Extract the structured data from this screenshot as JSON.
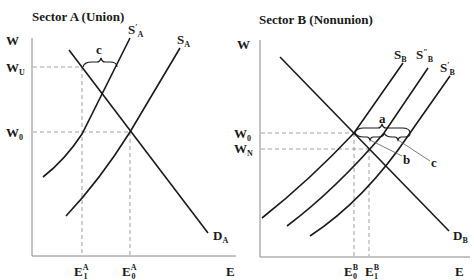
{
  "panels": [
    {
      "title": "Sector A (Union)",
      "y_axis": "W",
      "x_axis": "E",
      "wage_labels": {
        "high": {
          "main": "W",
          "sub": "U"
        },
        "base": {
          "main": "W",
          "sub": "0"
        }
      },
      "employment_labels": [
        {
          "main": "E",
          "sup": "A",
          "sub": "1"
        },
        {
          "main": "E",
          "sup": "A",
          "sub": "0"
        }
      ],
      "curves": {
        "demand": {
          "main": "D",
          "sub": "A"
        },
        "supply": {
          "main": "S",
          "sub": "A"
        },
        "supply_shifted": {
          "main": "S",
          "prime": "′",
          "sub": "A"
        }
      },
      "brace_label": "c"
    },
    {
      "title": "Sector B (Nonunion)",
      "y_axis": "W",
      "x_axis": "E",
      "wage_labels": {
        "base": {
          "main": "W",
          "sub": "0"
        },
        "low": {
          "main": "W",
          "sub": "N"
        }
      },
      "employment_labels": [
        {
          "main": "E",
          "sup": "B",
          "sub": "0"
        },
        {
          "main": "E",
          "sup": "B",
          "sub": "1"
        }
      ],
      "curves": {
        "demand": {
          "main": "D",
          "sub": "B"
        },
        "supply": {
          "main": "S",
          "sub": "B"
        },
        "supply_double_prime": {
          "main": "S",
          "prime": "″",
          "sub": "B"
        },
        "supply_prime": {
          "main": "S",
          "prime": "′",
          "sub": "B"
        }
      },
      "brace_labels": {
        "a": "a",
        "b": "b",
        "c": "c"
      }
    }
  ]
}
